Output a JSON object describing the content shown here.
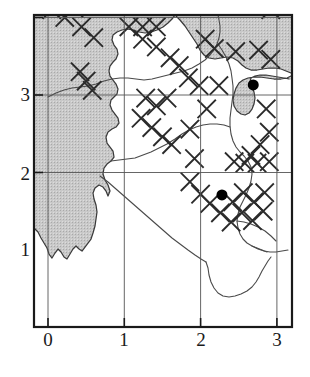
{
  "figure": {
    "type": "map-scatter",
    "title": "",
    "background_color": "#ffffff",
    "frame_color": "#1a1a1a",
    "grid_color": "#555555",
    "sea_fill_color": "#c9c9c9",
    "land_fill_color": "#ffffff",
    "coastline_color": "#3a3a3a",
    "boundary_color": "#4a4a4a",
    "hatch_color": "#2b2b2b",
    "dot_color": "#000000"
  },
  "axes": {
    "x": {
      "label": "",
      "ticks": [
        "0",
        "1",
        "2",
        "3"
      ],
      "tick_values": [
        0,
        1,
        2,
        3
      ],
      "range": [
        -0.2,
        3.2
      ],
      "pixel_origin": 48,
      "pixel_per_unit": 76.3
    },
    "y": {
      "label": "",
      "ticks": [
        "1",
        "2",
        "3"
      ],
      "tick_values": [
        1,
        2,
        3
      ],
      "range": [
        0.0,
        3.9
      ],
      "pixel_origin": 250,
      "pixel_per_unit": 77.5
    },
    "grid": true,
    "frame": true
  },
  "chart_data": {
    "type": "scatter",
    "title": "",
    "xlabel": "",
    "ylabel": "",
    "xlim": [
      -0.2,
      3.2
    ],
    "ylim": [
      0.0,
      3.9
    ],
    "grid": true,
    "legend": "none",
    "xticks": [
      0,
      1,
      2,
      3
    ],
    "yticks": [
      1,
      2,
      3
    ],
    "series": [
      {
        "name": "sample-sites",
        "marker": "filled-circle",
        "color": "#000000",
        "size": 11,
        "points": [
          {
            "x": 2.69,
            "y": 2.13
          },
          {
            "x": 2.28,
            "y": 0.71
          }
        ]
      },
      {
        "name": "hatch-x-markers",
        "marker": "x-cross",
        "color": "#2b2b2b",
        "size": 17,
        "points": [
          {
            "x": 0.34,
            "y": 3.46
          },
          {
            "x": 0.52,
            "y": 3.58
          },
          {
            "x": 0.52,
            "y": 3.34
          },
          {
            "x": 0.7,
            "y": 3.46
          },
          {
            "x": 0.88,
            "y": 3.58
          },
          {
            "x": 0.88,
            "y": 3.34
          },
          {
            "x": 1.06,
            "y": 3.46
          },
          {
            "x": 1.24,
            "y": 3.58
          },
          {
            "x": 0.17,
            "y": 3.24
          },
          {
            "x": 0.05,
            "y": 3.1
          },
          {
            "x": 0.34,
            "y": 3.12
          },
          {
            "x": 0.22,
            "y": 3.0
          },
          {
            "x": 1.78,
            "y": 3.46
          },
          {
            "x": 2.78,
            "y": 3.22
          },
          {
            "x": 2.92,
            "y": 3.1
          },
          {
            "x": 0.44,
            "y": 2.88
          },
          {
            "x": 0.6,
            "y": 2.74
          },
          {
            "x": 1.06,
            "y": 2.88
          },
          {
            "x": 1.24,
            "y": 2.88
          },
          {
            "x": 1.24,
            "y": 2.72
          },
          {
            "x": 1.42,
            "y": 2.88
          },
          {
            "x": 1.42,
            "y": 2.62
          },
          {
            "x": 1.6,
            "y": 2.48
          },
          {
            "x": 1.72,
            "y": 2.38
          },
          {
            "x": 2.06,
            "y": 2.72
          },
          {
            "x": 2.18,
            "y": 2.6
          },
          {
            "x": 2.46,
            "y": 2.56
          },
          {
            "x": 2.76,
            "y": 2.58
          },
          {
            "x": 2.92,
            "y": 2.46
          },
          {
            "x": 0.42,
            "y": 2.3
          },
          {
            "x": 0.5,
            "y": 2.18
          },
          {
            "x": 0.58,
            "y": 2.06
          },
          {
            "x": 1.84,
            "y": 2.22
          },
          {
            "x": 1.98,
            "y": 2.12
          },
          {
            "x": 2.24,
            "y": 2.12
          },
          {
            "x": 1.28,
            "y": 1.96
          },
          {
            "x": 1.42,
            "y": 1.86
          },
          {
            "x": 1.56,
            "y": 1.96
          },
          {
            "x": 2.08,
            "y": 1.82
          },
          {
            "x": 2.86,
            "y": 1.82
          },
          {
            "x": 1.22,
            "y": 1.7
          },
          {
            "x": 1.36,
            "y": 1.58
          },
          {
            "x": 1.5,
            "y": 1.46
          },
          {
            "x": 1.62,
            "y": 1.36
          },
          {
            "x": 1.86,
            "y": 1.56
          },
          {
            "x": 2.9,
            "y": 1.52
          },
          {
            "x": 2.78,
            "y": 1.36
          },
          {
            "x": 2.66,
            "y": 1.22
          },
          {
            "x": 1.92,
            "y": 1.18
          },
          {
            "x": 2.44,
            "y": 1.14
          },
          {
            "x": 2.58,
            "y": 1.12
          },
          {
            "x": 2.74,
            "y": 1.12
          },
          {
            "x": 2.9,
            "y": 1.14
          },
          {
            "x": 1.86,
            "y": 0.88
          },
          {
            "x": 2.0,
            "y": 0.72
          },
          {
            "x": 2.12,
            "y": 0.6
          },
          {
            "x": 2.26,
            "y": 0.48
          },
          {
            "x": 2.4,
            "y": 0.36
          },
          {
            "x": 2.54,
            "y": 0.48
          },
          {
            "x": 2.42,
            "y": 0.62
          },
          {
            "x": 2.56,
            "y": 0.74
          },
          {
            "x": 2.7,
            "y": 0.62
          },
          {
            "x": 2.84,
            "y": 0.74
          },
          {
            "x": 2.68,
            "y": 0.38
          },
          {
            "x": 2.82,
            "y": 0.5
          }
        ]
      }
    ],
    "regions": [
      {
        "name": "sea",
        "fill": "#c9c9c9",
        "description": "shaded water area along west and north"
      },
      {
        "name": "land",
        "fill": "#ffffff",
        "description": "unshaded peninsula interior"
      }
    ]
  },
  "x_tick_labels": [
    {
      "text": "0",
      "left": 37,
      "top": 330
    },
    {
      "text": "1",
      "left": 113,
      "top": 330
    },
    {
      "text": "2",
      "left": 190,
      "top": 330
    },
    {
      "text": "3",
      "left": 266,
      "top": 330
    }
  ],
  "y_tick_labels": [
    {
      "text": "3",
      "left": 10,
      "top": 85
    },
    {
      "text": "2",
      "left": 10,
      "top": 164
    },
    {
      "text": "1",
      "left": 10,
      "top": 240
    }
  ]
}
